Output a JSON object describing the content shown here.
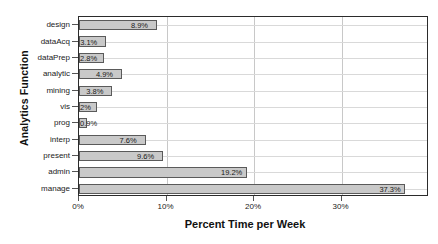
{
  "chart_data": {
    "type": "bar",
    "orientation": "horizontal",
    "title": "",
    "xlabel": "Percent Time per Week",
    "ylabel": "Analytics Function",
    "categories": [
      "design",
      "dataAcq",
      "dataPrep",
      "analytic",
      "mining",
      "vis",
      "prog",
      "interp",
      "present",
      "admin",
      "manage"
    ],
    "values": [
      8.9,
      3.1,
      2.8,
      4.9,
      3.8,
      2.0,
      0.9,
      7.6,
      9.6,
      19.2,
      37.3
    ],
    "data_labels": [
      "8.9%",
      "3.1%",
      "2.8%",
      "4.9%",
      "3.8%",
      "2%",
      "0.9%",
      "7.6%",
      "9.6%",
      "19.2%",
      "37.3%"
    ],
    "xlim": [
      0,
      40
    ],
    "xticks": [
      0,
      10,
      20,
      30
    ],
    "xticklabels": [
      "0%",
      "10%",
      "20%",
      "30%"
    ],
    "grid": "vertical-and-horizontal",
    "legend": "none",
    "bar_fill": "#c9c9c9",
    "bar_edge": "#5a5a5a"
  }
}
